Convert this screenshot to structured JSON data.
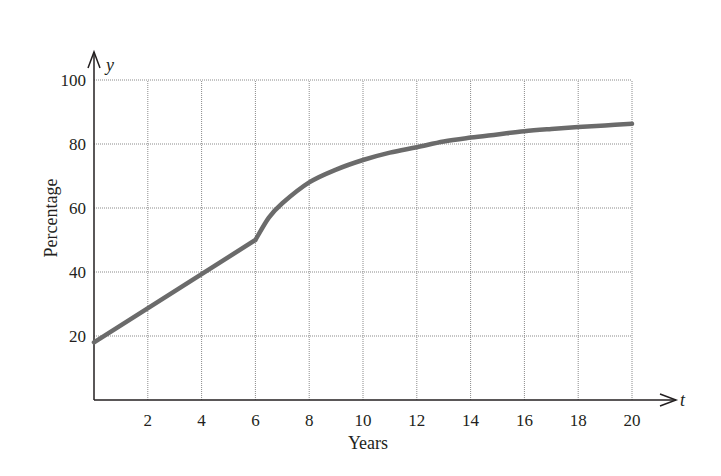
{
  "chart_data": {
    "type": "line",
    "title": "",
    "xlabel": "Years",
    "ylabel": "Percentage",
    "x_axis_variable": "t",
    "y_axis_variable": "y",
    "xlim": [
      0,
      20
    ],
    "ylim": [
      0,
      100
    ],
    "x_ticks": [
      2,
      4,
      6,
      8,
      10,
      12,
      14,
      16,
      18,
      20
    ],
    "y_ticks": [
      20,
      40,
      60,
      80,
      100
    ],
    "grid": true,
    "legend": null,
    "series": [
      {
        "name": "Percentage",
        "color": "#6b6b6b",
        "x": [
          0,
          1,
          2,
          3,
          4,
          5,
          6,
          6.5,
          7,
          8,
          9,
          10,
          11,
          12,
          13,
          14,
          15,
          16,
          17,
          18,
          19,
          20
        ],
        "y": [
          18,
          23.3,
          28.7,
          34,
          39.3,
          44.7,
          50,
          57,
          61.5,
          68,
          72,
          75,
          77.3,
          79,
          80.8,
          82,
          83,
          84,
          84.7,
          85.3,
          85.8,
          86.3
        ]
      }
    ],
    "annotations": [
      "Piecewise: linear from t=0 to t=6, then concave increasing curve approaching ~87"
    ]
  }
}
